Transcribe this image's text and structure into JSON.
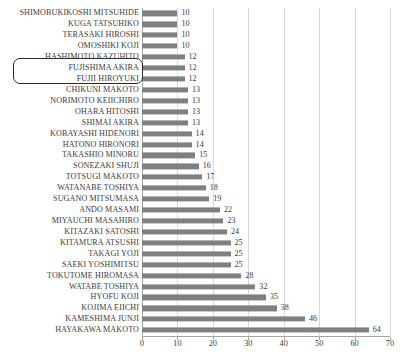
{
  "chart_data": {
    "type": "bar",
    "orientation": "horizontal",
    "title": "",
    "xlabel": "",
    "ylabel": "",
    "xlim": [
      0,
      70
    ],
    "xticks": [
      0,
      10,
      20,
      30,
      40,
      50,
      60,
      70
    ],
    "grid": true,
    "legend": false,
    "bar_color": "#808080",
    "categories": [
      "SHIMOBUKIKOSHI MITSUHIDE",
      "KUGA TATSUHIKO",
      "TERASAKI HIROSHI",
      "OMOSHIKI KOJI",
      "HASHIMOTO KAZUHITO",
      "FUJISHIMA AKIRA",
      "FUJII HIROYUKI",
      "CHIKUNI MAKOTO",
      "NORIMOTO KEIICHIRO",
      "OHARA HITOSHI",
      "SHIMAI AKIRA",
      "KOBAYASHI HIDENORI",
      "HATONO HIRONORI",
      "TAKASHIO MINORU",
      "SONEZAKI SHUJI",
      "TOTSUGI MAKOTO",
      "WATANABE TOSHIYA",
      "SUGANO MITSUMASA",
      "ANDO MASAMI",
      "MIYAUCHI MASAHIRO",
      "KITAZAKI SATOSHI",
      "KITAMURA ATSUSHI",
      "TAKAGI YOJI",
      "SAEKI YOSHIMITSU",
      "TOKUTOME HIROMASA",
      "WATABE TOSHIYA",
      "HYOFU KOJI",
      "KOJIMA EIICHI",
      "KAMESHIMA JUNJI",
      "HAYAKAWA MAKOTO"
    ],
    "values": [
      10,
      10,
      10,
      10,
      12,
      12,
      12,
      13,
      13,
      13,
      13,
      14,
      14,
      15,
      16,
      17,
      18,
      19,
      22,
      23,
      24,
      25,
      25,
      25,
      28,
      32,
      35,
      38,
      46,
      64
    ]
  },
  "annotation": {
    "type": "rounded-rect-highlight",
    "covers": [
      "HASHIMOTO KAZUHITO",
      "FUJISHIMA AKIRA"
    ],
    "border_color": "#2b2b2b"
  }
}
